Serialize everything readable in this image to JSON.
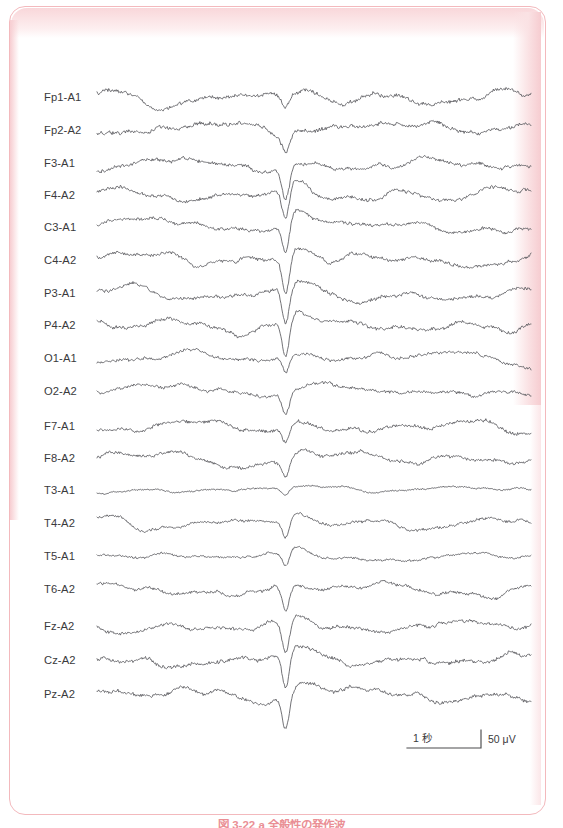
{
  "figure": {
    "caption": "図 3-22 a 全般性の発作波",
    "frame_color": "#f3b9bd",
    "trace_color": "#5a5a5e",
    "label_color": "#3a3a3c"
  },
  "calibration": {
    "time_label": "1 秒",
    "amplitude_label": "50 μV",
    "amplitude_value": "50",
    "amplitude_unit": "μV"
  },
  "chart_data": {
    "type": "line",
    "title": "",
    "subtitle": "",
    "xlabel": "",
    "ylabel": "",
    "grid": false,
    "legend_position": "none",
    "x_axis": {
      "unit": "seconds",
      "scale_bar_seconds": 1,
      "total_duration_seconds": 6.0,
      "tick_labels": []
    },
    "y_axis": {
      "unit": "microvolts",
      "scale_bar_microvolts": 50,
      "tick_labels": []
    },
    "montage": "referential (ear reference A1/A2)",
    "annotations": [
      "Generalized synchronized high-amplitude spike-and-slow-wave discharge at approximately 2.6 s across all channels"
    ],
    "categories": [
      "Fp1-A1",
      "Fp2-A2",
      "F3-A1",
      "F4-A2",
      "C3-A1",
      "C4-A2",
      "P3-A1",
      "P4-A2",
      "O1-A1",
      "O2-A2",
      "F7-A1",
      "F8-A2",
      "T3-A1",
      "T4-A2",
      "T5-A1",
      "T6-A2",
      "Fz-A2",
      "Cz-A2",
      "Pz-A2"
    ],
    "series": [
      {
        "name": "Fp1-A1",
        "label": "Fp1-A1",
        "y": 91,
        "amplitude": 7.5,
        "seed": 11,
        "burst": 0.35
      },
      {
        "name": "Fp2-A2",
        "label": "Fp2-A2",
        "y": 124,
        "amplitude": 7.8,
        "seed": 23,
        "burst": 0.4
      },
      {
        "name": "F3-A1",
        "label": "F3-A1",
        "y": 157,
        "amplitude": 7.0,
        "seed": 37,
        "burst": 0.85
      },
      {
        "name": "F4-A2",
        "label": "F4-A2",
        "y": 189,
        "amplitude": 6.8,
        "seed": 41,
        "burst": 0.9
      },
      {
        "name": "C3-A1",
        "label": "C3-A1",
        "y": 221,
        "amplitude": 6.5,
        "seed": 53,
        "burst": 1.0
      },
      {
        "name": "C4-A2",
        "label": "C4-A2",
        "y": 254,
        "amplitude": 6.6,
        "seed": 67,
        "burst": 1.05
      },
      {
        "name": "P3-A1",
        "label": "P3-A1",
        "y": 287,
        "amplitude": 6.4,
        "seed": 71,
        "burst": 1.1
      },
      {
        "name": "P4-A2",
        "label": "P4-A2",
        "y": 319,
        "amplitude": 6.8,
        "seed": 83,
        "burst": 1.05
      },
      {
        "name": "O1-A1",
        "label": "O1-A1",
        "y": 352,
        "amplitude": 6.0,
        "seed": 97,
        "burst": 0.55
      },
      {
        "name": "O2-A2",
        "label": "O2-A2",
        "y": 385,
        "amplitude": 6.2,
        "seed": 103,
        "burst": 0.6
      },
      {
        "name": "F7-A1",
        "label": "F7-A1",
        "y": 420,
        "amplitude": 6.6,
        "seed": 109,
        "burst": 0.5
      },
      {
        "name": "F8-A2",
        "label": "F8-A2",
        "y": 452,
        "amplitude": 6.4,
        "seed": 113,
        "burst": 0.55
      },
      {
        "name": "T3-A1",
        "label": "T3-A1",
        "y": 484,
        "amplitude": 3.2,
        "seed": 127,
        "burst": 0.45
      },
      {
        "name": "T4-A2",
        "label": "T4-A2",
        "y": 517,
        "amplitude": 5.2,
        "seed": 131,
        "burst": 0.75
      },
      {
        "name": "T5-A1",
        "label": "T5-A1",
        "y": 550,
        "amplitude": 4.2,
        "seed": 139,
        "burst": 0.7
      },
      {
        "name": "T6-A2",
        "label": "T6-A2",
        "y": 583,
        "amplitude": 6.0,
        "seed": 149,
        "burst": 0.8
      },
      {
        "name": "Fz-A2",
        "label": "Fz-A2",
        "y": 620,
        "amplitude": 6.4,
        "seed": 151,
        "burst": 0.95
      },
      {
        "name": "Cz-A2",
        "label": "Cz-A2",
        "y": 654,
        "amplitude": 7.0,
        "seed": 163,
        "burst": 1.0
      },
      {
        "name": "Pz-A2",
        "label": "Pz-A2",
        "y": 688,
        "amplitude": 6.8,
        "seed": 167,
        "burst": 0.95
      }
    ],
    "geometry": {
      "label_x": 35,
      "trace_x_start": 88,
      "trace_x_end": 522,
      "samples": 520
    },
    "calibration_bar": {
      "x_start": 398,
      "x_end": 472,
      "y": 742,
      "tick_height": 18
    }
  }
}
